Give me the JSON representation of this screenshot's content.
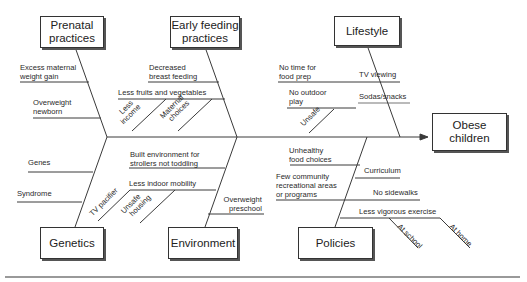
{
  "effect": "Obese children",
  "categories": {
    "prenatal": {
      "title": "Prenatal practices",
      "title_lines": [
        "Prenatal",
        "practices"
      ],
      "causes": [
        {
          "lines": [
            "Excess maternal",
            "weight gain"
          ]
        },
        {
          "lines": [
            "Overweight",
            "newborn"
          ]
        }
      ]
    },
    "early_feeding": {
      "title": "Early feeding practices",
      "title_lines": [
        "Early feeding",
        "practices"
      ],
      "causes": [
        {
          "lines": [
            "Decreased",
            "breast feeding"
          ]
        },
        {
          "lines": [
            "Less fruits and vegetables"
          ],
          "sub_causes": [
            {
              "lines": [
                "Less",
                "income"
              ]
            },
            {
              "lines": [
                "Maternal",
                "choices"
              ]
            }
          ]
        }
      ]
    },
    "lifestyle": {
      "title": "Lifestyle",
      "causes": [
        {
          "lines": [
            "No time for",
            "food prep"
          ]
        },
        {
          "lines": [
            "TV viewing"
          ]
        },
        {
          "lines": [
            "No outdoor",
            "play"
          ],
          "sub_causes": [
            {
              "lines": [
                "Unsafe"
              ]
            }
          ]
        },
        {
          "lines": [
            "Sodas/snacks"
          ]
        }
      ]
    },
    "genetics": {
      "title": "Genetics",
      "causes": [
        {
          "lines": [
            "Genes"
          ]
        },
        {
          "lines": [
            "Syndrome"
          ]
        }
      ]
    },
    "environment": {
      "title": "Environment",
      "causes": [
        {
          "lines": [
            "Built environment for",
            "strollers not toddling"
          ]
        },
        {
          "lines": [
            "Less indoor mobility"
          ],
          "sub_causes": [
            {
              "lines": [
                "TV pacifier"
              ]
            },
            {
              "lines": [
                "Unsafe",
                "housing"
              ]
            }
          ]
        },
        {
          "lines": [
            "Overweight",
            "preschool"
          ]
        }
      ]
    },
    "policies": {
      "title": "Policies",
      "causes": [
        {
          "lines": [
            "Unhealthy",
            "food choices"
          ]
        },
        {
          "lines": [
            "Few community",
            "recreational areas",
            "or programs"
          ]
        },
        {
          "lines": [
            "Curriculum"
          ]
        },
        {
          "lines": [
            "No sidewalks"
          ]
        },
        {
          "lines": [
            "Less vigorous exercise"
          ],
          "sub_causes": [
            {
              "lines": [
                "At school"
              ]
            },
            {
              "lines": [
                "At home"
              ]
            }
          ]
        }
      ]
    }
  },
  "colors": {
    "line": "#3a3a3a",
    "text": "#2a2a2a",
    "box_border": "#333333"
  }
}
